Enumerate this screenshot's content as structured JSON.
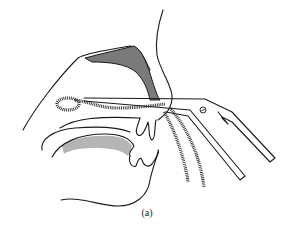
{
  "figure": {
    "caption": "(a)",
    "colors": {
      "line": "#1a1a1a",
      "shade_dark": "#7a7a7a",
      "shade_light": "#b5b5b5",
      "background": "#ffffff"
    },
    "icons": [
      "instrument-screw-icon"
    ]
  }
}
